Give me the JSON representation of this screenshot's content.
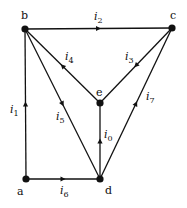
{
  "diagram": {
    "type": "directed-graph",
    "nodes": [
      {
        "id": "a",
        "label": "a",
        "x": 26,
        "y": 179,
        "lx": 17,
        "ly": 195
      },
      {
        "id": "b",
        "label": "b",
        "x": 25,
        "y": 29,
        "lx": 21,
        "ly": 19
      },
      {
        "id": "c",
        "label": "c",
        "x": 172,
        "y": 28,
        "lx": 170,
        "ly": 19
      },
      {
        "id": "d",
        "label": "d",
        "x": 100,
        "y": 179,
        "lx": 105,
        "ly": 194
      },
      {
        "id": "e",
        "label": "e",
        "x": 100,
        "y": 103,
        "lx": 96,
        "ly": 96
      }
    ],
    "edges": [
      {
        "id": "i0",
        "from": "d",
        "to": "e",
        "label": "i",
        "sub": "0",
        "lx": 104,
        "ly": 138
      },
      {
        "id": "i1",
        "from": "a",
        "to": "b",
        "label": "i",
        "sub": "1",
        "lx": 10,
        "ly": 113
      },
      {
        "id": "i2",
        "from": "b",
        "to": "c",
        "label": "i",
        "sub": "2",
        "lx": 94,
        "ly": 20
      },
      {
        "id": "i3",
        "from": "c",
        "to": "e",
        "label": "i",
        "sub": "3",
        "lx": 125,
        "ly": 60
      },
      {
        "id": "i4",
        "from": "e",
        "to": "b",
        "label": "i",
        "sub": "4",
        "lx": 65,
        "ly": 60
      },
      {
        "id": "i5",
        "from": "b",
        "to": "d",
        "label": "i",
        "sub": "5",
        "lx": 56,
        "ly": 120
      },
      {
        "id": "i6",
        "from": "a",
        "to": "d",
        "label": "i",
        "sub": "6",
        "lx": 60,
        "ly": 194
      },
      {
        "id": "i7",
        "from": "d",
        "to": "c",
        "label": "i",
        "sub": "7",
        "lx": 146,
        "ly": 100
      }
    ]
  }
}
